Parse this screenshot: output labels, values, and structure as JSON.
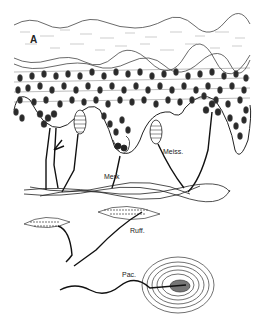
{
  "figure": {
    "panel_label": "A",
    "labels": {
      "merkel": "Merk",
      "meissner": "Meiss.",
      "ruffini": "Ruff.",
      "pacinian": "Pac."
    },
    "colors": {
      "background": "#ffffff",
      "ink": "#1a1a1a",
      "nucleus": "#333333"
    }
  }
}
